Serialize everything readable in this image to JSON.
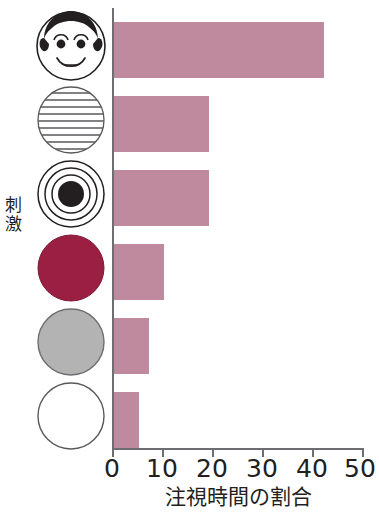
{
  "chart_data": {
    "type": "bar",
    "orientation": "horizontal",
    "title": "",
    "xlabel": "注視時間の割合",
    "ylabel": "刺激",
    "xlim": [
      0,
      50
    ],
    "xticks": [
      0,
      10,
      20,
      30,
      40,
      50
    ],
    "xtick_labels": [
      "0",
      "10",
      "20",
      "30",
      "40",
      "50"
    ],
    "grid": false,
    "legend": "none",
    "bar_color": "#c08a9e",
    "axis_color": "#6d6e71",
    "categories": [
      "face",
      "horizontal-stripes-circle",
      "bullseye-circle",
      "solid-red-circle",
      "solid-gray-circle",
      "empty-white-circle"
    ],
    "category_labels": [
      "人の顔",
      "縞模様",
      "同心円",
      "赤色",
      "灰色",
      "白色"
    ],
    "values": [
      42,
      19,
      19,
      10,
      7,
      5
    ],
    "series": [
      {
        "name": "注視時間の割合",
        "values": [
          42,
          19,
          19,
          10,
          7,
          5
        ]
      }
    ]
  },
  "axes": {
    "y_title": "刺激",
    "y_title_chars": [
      "刺",
      "激"
    ],
    "x_title": "注視時間の割合",
    "x_tick_labels": [
      "0",
      "10",
      "20",
      "30",
      "40",
      "50"
    ]
  },
  "icons": [
    {
      "name": "face-icon",
      "fill": "#ffffff",
      "detail_color": "#231f20"
    },
    {
      "name": "horizontal-stripes-circle-icon",
      "fill": "#ffffff",
      "detail_color": "#58595b"
    },
    {
      "name": "bullseye-circle-icon",
      "fill": "#ffffff",
      "detail_color": "#231f20"
    },
    {
      "name": "solid-red-circle-icon",
      "fill": "#9b1f42",
      "detail_color": "#9b1f42"
    },
    {
      "name": "solid-gray-circle-icon",
      "fill": "#b3b3b3",
      "detail_color": "#808285"
    },
    {
      "name": "empty-white-circle-icon",
      "fill": "#ffffff",
      "detail_color": "#58595b"
    }
  ],
  "colors": {
    "bar": "#c08a9e",
    "axis": "#6d6e71",
    "red_stimulus": "#9b1f42",
    "gray_stimulus": "#b3b3b3",
    "text": "#231f20"
  }
}
